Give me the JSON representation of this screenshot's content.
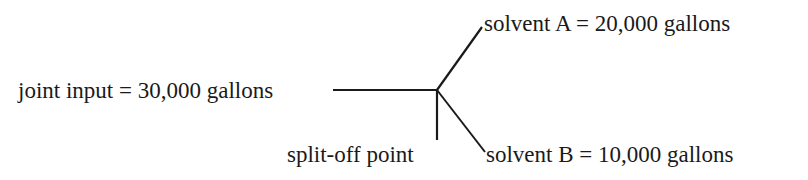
{
  "diagram": {
    "type": "joint-cost split-off diagram",
    "input": {
      "label": "joint input = 30,000 gallons",
      "quantity": 30000,
      "unit": "gallons"
    },
    "split_off": {
      "label": "split-off point"
    },
    "outputs": [
      {
        "label": "solvent A = 20,000 gallons",
        "name": "solvent A",
        "quantity": 20000,
        "unit": "gallons"
      },
      {
        "label": "solvent B = 10,000 gallons",
        "name": "solvent B",
        "quantity": 10000,
        "unit": "gallons"
      }
    ],
    "line_color": "#1a1a1a"
  }
}
